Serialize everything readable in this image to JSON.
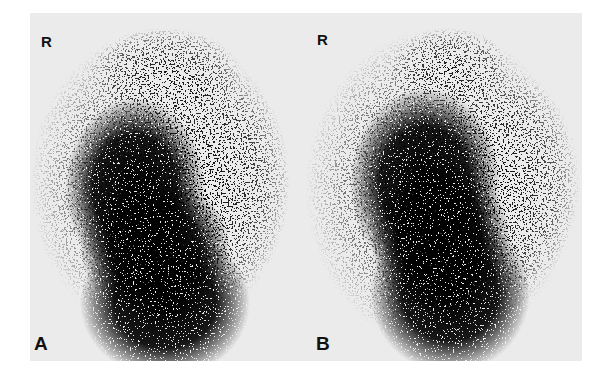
{
  "figure": {
    "type": "grayscale scintigraphy image pair",
    "background_color": "#ebebeb",
    "ink_color": "#0a0a0a",
    "panels": [
      {
        "id": "A",
        "orientation_label": "R",
        "panel_label": "A"
      },
      {
        "id": "B",
        "orientation_label": "R",
        "panel_label": "B"
      }
    ]
  }
}
